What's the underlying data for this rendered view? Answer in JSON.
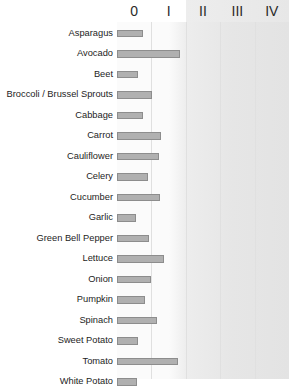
{
  "chart_data": {
    "type": "bar",
    "orientation": "horizontal",
    "title": "",
    "xlabel": "",
    "ylabel": "",
    "xlim": [
      0,
      5
    ],
    "grid": true,
    "legend": null,
    "tick_labels": [
      "0",
      "I",
      "II",
      "III",
      "IV"
    ],
    "tick_values": [
      0,
      1,
      2,
      3,
      4
    ],
    "categories": [
      "Asparagus",
      "Avocado",
      "Beet",
      "Broccoli / Brussel Sprouts",
      "Cabbage",
      "Carrot",
      "Cauliflower",
      "Celery",
      "Cucumber",
      "Garlic",
      "Green Bell Pepper",
      "Lettuce",
      "Onion",
      "Pumpkin",
      "Spinach",
      "Sweet Potato",
      "Tomato",
      "White Potato"
    ],
    "values": [
      0.75,
      1.82,
      0.62,
      1.02,
      0.75,
      1.27,
      1.22,
      0.9,
      1.25,
      0.55,
      0.92,
      1.38,
      0.98,
      0.8,
      1.15,
      0.62,
      1.78,
      0.58
    ],
    "bar_color": "#b0b0b0",
    "bar_edge_color": "#8d8d8d",
    "shaded_region_start": "II",
    "shaded_region_color": "#e7e7e7",
    "background_color": "#ffffff"
  },
  "axis": {
    "header_labels": [
      "0",
      "I",
      "II",
      "III",
      "IV"
    ]
  },
  "rows": [
    {
      "label": "Asparagus"
    },
    {
      "label": "Avocado"
    },
    {
      "label": "Beet"
    },
    {
      "label": "Broccoli / Brussel Sprouts"
    },
    {
      "label": "Cabbage"
    },
    {
      "label": "Carrot"
    },
    {
      "label": "Cauliflower"
    },
    {
      "label": "Celery"
    },
    {
      "label": "Cucumber"
    },
    {
      "label": "Garlic"
    },
    {
      "label": "Green Bell Pepper"
    },
    {
      "label": "Lettuce"
    },
    {
      "label": "Onion"
    },
    {
      "label": "Pumpkin"
    },
    {
      "label": "Spinach"
    },
    {
      "label": "Sweet Potato"
    },
    {
      "label": "Tomato"
    },
    {
      "label": "White Potato"
    }
  ]
}
